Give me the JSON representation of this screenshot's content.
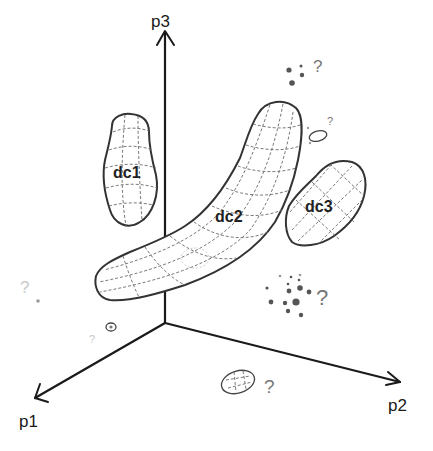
{
  "axes": {
    "p1": {
      "label": "p1"
    },
    "p2": {
      "label": "p2"
    },
    "p3": {
      "label": "p3"
    }
  },
  "clusters": [
    {
      "id": "dc1",
      "label": "dc1"
    },
    {
      "id": "dc2",
      "label": "dc2"
    },
    {
      "id": "dc3",
      "label": "dc3"
    }
  ],
  "uncertain_markers": [
    {
      "position": "top-right",
      "symbol": "?"
    },
    {
      "position": "near-dc2-tip",
      "symbol": "?"
    },
    {
      "position": "left-faint",
      "symbol": "?"
    },
    {
      "position": "lower-left-small-blob",
      "symbol": "?"
    },
    {
      "position": "right-dot-cloud",
      "symbol": "?"
    },
    {
      "position": "bottom-ellipse",
      "symbol": "?"
    }
  ],
  "colors": {
    "stroke": "#1a1a1a",
    "grid": "#6a6a6a",
    "background": "#ffffff"
  }
}
